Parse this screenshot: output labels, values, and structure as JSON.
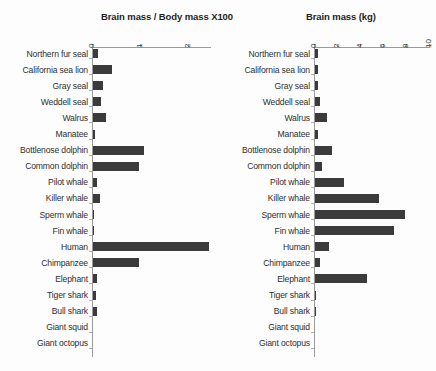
{
  "categories": [
    "Northern fur seal",
    "California sea lion",
    "Gray seal",
    "Weddell seal",
    "Walrus",
    "Manatee",
    "Bottlenose dolphin",
    "Common dolphin",
    "Pilot whale",
    "Killer whale",
    "Sperm whale",
    "Fin whale",
    "Human",
    "Chimpanzee",
    "Elephant",
    "Tiger shark",
    "Bull shark",
    "Giant squid",
    "Giant octopus"
  ],
  "chart_data": [
    {
      "type": "bar",
      "orientation": "horizontal",
      "title": "Brain mass / Body mass X100",
      "xlabel": "",
      "ylabel": "",
      "xlim": [
        0,
        2.45
      ],
      "ticks": [
        0,
        1,
        2
      ],
      "tick_labels": [
        "0",
        "1",
        "2"
      ],
      "grid": false,
      "legend": "none",
      "bar_color": "#3b3b3b",
      "categories": [
        "Northern fur seal",
        "California sea lion",
        "Gray seal",
        "Weddell seal",
        "Walrus",
        "Manatee",
        "Bottlenose dolphin",
        "Common dolphin",
        "Pilot whale",
        "Killer whale",
        "Sperm whale",
        "Fin whale",
        "Human",
        "Chimpanzee",
        "Elephant",
        "Tiger shark",
        "Bull shark",
        "Giant squid",
        "Giant octopus"
      ],
      "values": [
        0.11,
        0.4,
        0.21,
        0.17,
        0.28,
        0.05,
        1.06,
        0.95,
        0.09,
        0.15,
        0.02,
        0.01,
        2.4,
        0.95,
        0.09,
        0.06,
        0.08,
        0.0,
        0.0
      ]
    },
    {
      "type": "bar",
      "orientation": "horizontal",
      "title": "Brain mass (kg)",
      "xlabel": "",
      "ylabel": "",
      "xlim": [
        0,
        10
      ],
      "ticks": [
        0,
        2,
        4,
        6,
        8,
        10
      ],
      "tick_labels": [
        "0",
        "2",
        "4",
        "6",
        "8",
        "10"
      ],
      "grid": false,
      "legend": "none",
      "bar_color": "#3b3b3b",
      "categories": [
        "Northern fur seal",
        "California sea lion",
        "Gray seal",
        "Weddell seal",
        "Walrus",
        "Manatee",
        "Bottlenose dolphin",
        "Common dolphin",
        "Pilot whale",
        "Killer whale",
        "Sperm whale",
        "Fin whale",
        "Human",
        "Chimpanzee",
        "Elephant",
        "Tiger shark",
        "Bull shark",
        "Giant squid",
        "Giant octopus"
      ],
      "values": [
        0.3,
        0.3,
        0.3,
        0.45,
        1.05,
        0.3,
        1.45,
        0.65,
        2.5,
        5.6,
        7.8,
        6.9,
        1.25,
        0.4,
        4.5,
        0.08,
        0.05,
        0.0,
        0.0
      ]
    }
  ]
}
